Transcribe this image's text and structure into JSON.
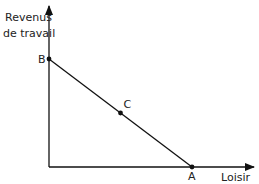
{
  "chart_data": {
    "type": "line",
    "title": "",
    "ylabel": [
      "Revenus",
      "de travail"
    ],
    "xlabel": "Loisir",
    "xlim": [
      0,
      1
    ],
    "ylim": [
      0,
      1
    ],
    "grid": false,
    "series": [
      {
        "name": "contrainte budgétaire",
        "points": [
          {
            "label": "B",
            "x": 0,
            "y": 1
          },
          {
            "label": "C",
            "x": 0.5,
            "y": 0.5
          },
          {
            "label": "A",
            "x": 1,
            "y": 0
          }
        ]
      }
    ]
  },
  "colors": {
    "ink": "#111111"
  }
}
